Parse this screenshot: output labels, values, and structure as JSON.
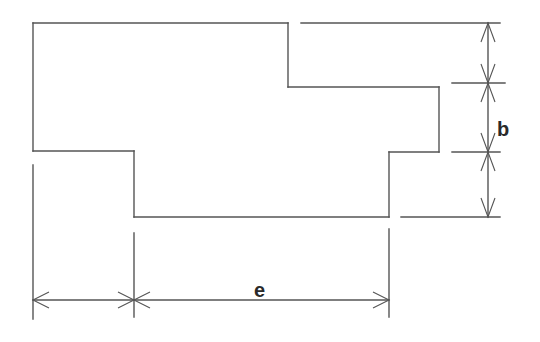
{
  "diagram": {
    "type": "technical-drawing",
    "line_color": "#555555",
    "label_color": "#2a2a2a",
    "labels": {
      "vertical_dimension": "b",
      "horizontal_dimension": "e"
    }
  }
}
